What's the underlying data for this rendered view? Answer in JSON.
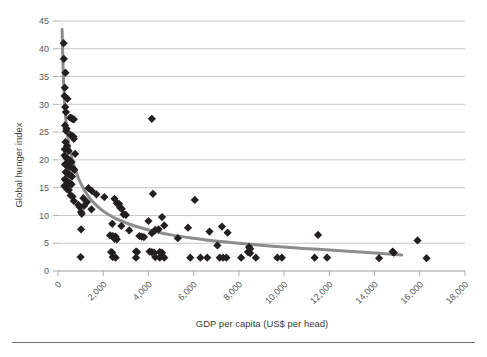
{
  "figure": {
    "clipped_header_text": "",
    "footer_rule": "horizontal-rule"
  },
  "chart_data": {
    "type": "scatter",
    "title": "",
    "subtitle": "",
    "xlabel": "GDP per capita (US$ per head)",
    "ylabel": "Global hunger index",
    "xlim": [
      0,
      18000
    ],
    "ylim": [
      0,
      45
    ],
    "xticks": [
      0,
      2000,
      4000,
      6000,
      8000,
      10000,
      12000,
      14000,
      16000,
      18000
    ],
    "xtick_labels": [
      "0",
      "2,000",
      "4,000",
      "6,000",
      "8,000",
      "10,000",
      "12,000",
      "14,000",
      "16,000",
      "18,000"
    ],
    "yticks": [
      0,
      5,
      10,
      15,
      20,
      25,
      30,
      35,
      40,
      45
    ],
    "ytick_labels": [
      "0",
      "5",
      "10",
      "15",
      "20",
      "25",
      "30",
      "35",
      "40",
      "45"
    ],
    "grid": "horizontal",
    "legend": "none",
    "marker": "diamond",
    "marker_color": "#231f20",
    "marker_size": 5,
    "trendline": {
      "present": true,
      "style": "power-curve",
      "color": "#8c8c8c",
      "width": 3,
      "points": [
        [
          180,
          43.5
        ],
        [
          230,
          36.0
        ],
        [
          280,
          31.0
        ],
        [
          340,
          27.5
        ],
        [
          420,
          24.5
        ],
        [
          520,
          22.0
        ],
        [
          650,
          19.8
        ],
        [
          800,
          17.8
        ],
        [
          1000,
          15.8
        ],
        [
          1250,
          14.0
        ],
        [
          1550,
          12.4
        ],
        [
          1900,
          11.1
        ],
        [
          2300,
          10.0
        ],
        [
          2800,
          9.0
        ],
        [
          3400,
          8.1
        ],
        [
          4100,
          7.3
        ],
        [
          5000,
          6.5
        ],
        [
          6000,
          5.9
        ],
        [
          7200,
          5.3
        ],
        [
          8500,
          4.8
        ],
        [
          10000,
          4.3
        ],
        [
          11500,
          3.9
        ],
        [
          13000,
          3.5
        ],
        [
          14200,
          3.2
        ],
        [
          15200,
          2.9
        ]
      ]
    },
    "points": [
      [
        250,
        41.0
      ],
      [
        260,
        38.2
      ],
      [
        330,
        35.7
      ],
      [
        300,
        33.0
      ],
      [
        290,
        31.5
      ],
      [
        420,
        31.0
      ],
      [
        320,
        29.5
      ],
      [
        350,
        28.6
      ],
      [
        540,
        27.6
      ],
      [
        600,
        27.5
      ],
      [
        640,
        27.4
      ],
      [
        700,
        27.3
      ],
      [
        310,
        26.2
      ],
      [
        380,
        25.6
      ],
      [
        360,
        25.2
      ],
      [
        560,
        24.5
      ],
      [
        620,
        24.3
      ],
      [
        680,
        24.2
      ],
      [
        700,
        23.8
      ],
      [
        330,
        23.2
      ],
      [
        400,
        22.5
      ],
      [
        300,
        21.9
      ],
      [
        470,
        21.6
      ],
      [
        760,
        21.1
      ],
      [
        290,
        20.8
      ],
      [
        360,
        20.4
      ],
      [
        420,
        20.2
      ],
      [
        480,
        20.0
      ],
      [
        540,
        19.8
      ],
      [
        600,
        19.6
      ],
      [
        310,
        19.2
      ],
      [
        380,
        19.0
      ],
      [
        450,
        18.9
      ],
      [
        520,
        18.7
      ],
      [
        680,
        18.4
      ],
      [
        720,
        18.2
      ],
      [
        340,
        17.8
      ],
      [
        400,
        17.6
      ],
      [
        470,
        17.4
      ],
      [
        560,
        17.2
      ],
      [
        620,
        17.0
      ],
      [
        300,
        16.5
      ],
      [
        370,
        16.2
      ],
      [
        440,
        16.0
      ],
      [
        520,
        15.8
      ],
      [
        600,
        15.6
      ],
      [
        280,
        15.3
      ],
      [
        340,
        15.1
      ],
      [
        1350,
        14.9
      ],
      [
        410,
        14.7
      ],
      [
        480,
        14.6
      ],
      [
        1500,
        14.4
      ],
      [
        4150,
        27.4
      ],
      [
        4200,
        13.9
      ],
      [
        1700,
        13.8
      ],
      [
        560,
        13.6
      ],
      [
        640,
        13.4
      ],
      [
        2050,
        13.3
      ],
      [
        1120,
        13.1
      ],
      [
        2500,
        13.0
      ],
      [
        6050,
        12.8
      ],
      [
        700,
        12.6
      ],
      [
        1280,
        12.4
      ],
      [
        2600,
        12.2
      ],
      [
        2700,
        12.1
      ],
      [
        900,
        11.9
      ],
      [
        1150,
        11.7
      ],
      [
        960,
        11.5
      ],
      [
        2750,
        11.4
      ],
      [
        2820,
        11.2
      ],
      [
        1480,
        11.1
      ],
      [
        1020,
        10.6
      ],
      [
        1050,
        10.3
      ],
      [
        2900,
        10.2
      ],
      [
        3000,
        10.1
      ],
      [
        4600,
        9.7
      ],
      [
        4000,
        9.0
      ],
      [
        2400,
        8.5
      ],
      [
        4700,
        8.2
      ],
      [
        2800,
        8.1
      ],
      [
        7250,
        8.0
      ],
      [
        5750,
        7.8
      ],
      [
        1020,
        7.5
      ],
      [
        4450,
        7.5
      ],
      [
        4300,
        7.4
      ],
      [
        3150,
        7.3
      ],
      [
        6700,
        7.1
      ],
      [
        7500,
        6.9
      ],
      [
        4150,
        6.8
      ],
      [
        11500,
        6.5
      ],
      [
        2300,
        6.4
      ],
      [
        2400,
        6.3
      ],
      [
        2450,
        6.2
      ],
      [
        2550,
        6.2
      ],
      [
        3600,
        6.3
      ],
      [
        3700,
        6.2
      ],
      [
        3800,
        6.1
      ],
      [
        5300,
        5.9
      ],
      [
        2500,
        5.8
      ],
      [
        2600,
        5.7
      ],
      [
        15900,
        5.5
      ],
      [
        7050,
        4.6
      ],
      [
        8450,
        4.3
      ],
      [
        8500,
        4.0
      ],
      [
        14800,
        3.5
      ],
      [
        14850,
        3.3
      ],
      [
        3450,
        3.5
      ],
      [
        3500,
        3.4
      ],
      [
        4050,
        3.5
      ],
      [
        4150,
        3.4
      ],
      [
        4250,
        3.3
      ],
      [
        4500,
        3.4
      ],
      [
        4600,
        3.3
      ],
      [
        2350,
        3.4
      ],
      [
        2400,
        3.3
      ],
      [
        8400,
        3.4
      ],
      [
        8500,
        3.2
      ],
      [
        1000,
        2.5
      ],
      [
        2420,
        2.5
      ],
      [
        2550,
        2.4
      ],
      [
        3450,
        2.4
      ],
      [
        4300,
        2.5
      ],
      [
        4500,
        2.4
      ],
      [
        4700,
        2.4
      ],
      [
        5850,
        2.4
      ],
      [
        6300,
        2.4
      ],
      [
        6600,
        2.4
      ],
      [
        7150,
        2.4
      ],
      [
        7300,
        2.4
      ],
      [
        7450,
        2.4
      ],
      [
        8100,
        2.4
      ],
      [
        8750,
        2.4
      ],
      [
        9700,
        2.4
      ],
      [
        9900,
        2.4
      ],
      [
        11350,
        2.4
      ],
      [
        11900,
        2.4
      ],
      [
        14200,
        2.3
      ],
      [
        16300,
        2.3
      ]
    ]
  }
}
